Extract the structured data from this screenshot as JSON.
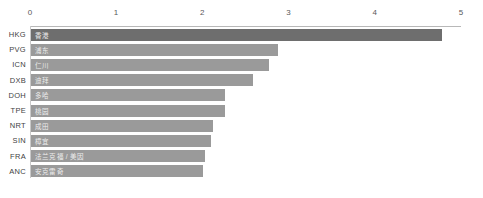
{
  "chart_data": {
    "type": "bar",
    "orientation": "horizontal",
    "title": "",
    "xlabel": "",
    "ylabel": "",
    "xlim": [
      0,
      5
    ],
    "xticks": [
      "0",
      "1",
      "2",
      "3",
      "4",
      "5"
    ],
    "grid": false,
    "legend": null,
    "categories": [
      "HKG",
      "PVG",
      "ICN",
      "DXB",
      "DOH",
      "TPE",
      "NRT",
      "SIN",
      "FRA",
      "ANC"
    ],
    "bar_labels": [
      "香港",
      "浦东",
      "仁川",
      "迪拜",
      "多哈",
      "桃园",
      "成田",
      "樟宜",
      "法兰克福 / 美因",
      "安克雷奇"
    ],
    "values": [
      4.77,
      2.86,
      2.76,
      2.58,
      2.25,
      2.25,
      2.11,
      2.09,
      2.02,
      2.0
    ],
    "highlight_index": 0,
    "colors": {
      "bar": "#9a9a9a",
      "bar_highlight": "#6e6e6e",
      "bar_label_text": "#ededed",
      "category_text": "#3f3f3f",
      "tick_text": "#595959",
      "axis_line": "#b8b8b8",
      "background": "#ffffff"
    }
  }
}
